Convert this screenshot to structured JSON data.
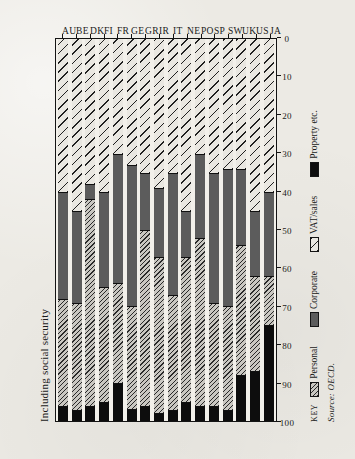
{
  "figure": {
    "note_label": "Including social security",
    "source_label": "Source: OECD.",
    "key_word": "KEY"
  },
  "legend": {
    "items": [
      {
        "label": "Personal",
        "swatch": "hatch-diagonal-dense",
        "color": "#c9c7c1"
      },
      {
        "label": "Corporate",
        "swatch": "solid-gray",
        "color": "#5c5c5c"
      },
      {
        "label": "VAT/sales",
        "swatch": "hatch-diagonal-wide",
        "color": "#e9e7e1"
      },
      {
        "label": "Property etc.",
        "swatch": "solid-black",
        "color": "#0d0d0d"
      }
    ]
  },
  "chart_data": {
    "type": "bar",
    "orientation": "horizontal-rotated",
    "stacked": true,
    "stack_total": 100,
    "title": "Including social security",
    "xlabel": "",
    "ylabel": "",
    "xlim": [
      0,
      100
    ],
    "grid": false,
    "legend_position": "bottom",
    "source": "Source: OECD.",
    "tick_labels": [
      "0",
      "10",
      "20",
      "30",
      "40",
      "50",
      "60",
      "70",
      "80",
      "90",
      "100"
    ],
    "tick_values": [
      0,
      10,
      20,
      30,
      40,
      50,
      60,
      70,
      80,
      90,
      100
    ],
    "categories": [
      "AU",
      "BE",
      "DK",
      "FI",
      "FR",
      "GE",
      "GR",
      "IR",
      "IT",
      "NE",
      "PO",
      "SP",
      "SW",
      "UK",
      "US",
      "JA"
    ],
    "series": [
      {
        "name": "VAT/sales",
        "values": [
          40,
          45,
          38,
          40,
          30,
          33,
          35,
          39,
          35,
          45,
          30,
          35,
          34,
          34,
          45,
          40
        ]
      },
      {
        "name": "Corporate",
        "values": [
          28,
          24,
          4,
          25,
          34,
          37,
          15,
          18,
          32,
          12,
          22,
          34,
          36,
          20,
          17,
          22
        ]
      },
      {
        "name": "Personal",
        "values": [
          28,
          28,
          54,
          30,
          26,
          27,
          46,
          41,
          30,
          38,
          44,
          27,
          27,
          34,
          25,
          13
        ]
      },
      {
        "name": "Property etc.",
        "values": [
          4,
          3,
          4,
          5,
          10,
          3,
          4,
          2,
          3,
          5,
          4,
          4,
          3,
          12,
          13,
          25
        ]
      }
    ]
  }
}
